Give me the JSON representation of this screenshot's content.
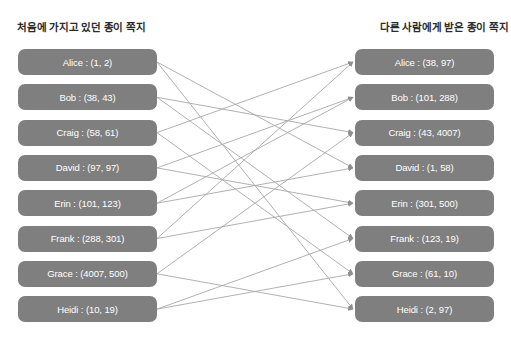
{
  "headers": {
    "left": "처음에 가지고 있던 종이 쪽지",
    "right": "다른 사람에게 받은 종이 쪽지"
  },
  "colors": {
    "node_fill": "#7f7f7f",
    "node_text": "#ffffff",
    "edge": "#a8a8a8",
    "title_text": "#2b2b2b",
    "background": "#ffffff"
  },
  "left_nodes": [
    {
      "name": "Alice",
      "value": "(1, 2)",
      "label": "Alice : (1, 2)"
    },
    {
      "name": "Bob",
      "value": "(38, 43)",
      "label": "Bob : (38, 43)"
    },
    {
      "name": "Craig",
      "value": "(58, 61)",
      "label": "Craig : (58, 61)"
    },
    {
      "name": "David",
      "value": "(97, 97)",
      "label": "David : (97, 97)"
    },
    {
      "name": "Erin",
      "value": "(101, 123)",
      "label": "Erin : (101, 123)"
    },
    {
      "name": "Frank",
      "value": "(288, 301)",
      "label": "Frank : (288, 301)"
    },
    {
      "name": "Grace",
      "value": "(4007, 500)",
      "label": "Grace : (4007, 500)"
    },
    {
      "name": "Heidi",
      "value": "(10, 19)",
      "label": "Heidi : (10, 19)"
    }
  ],
  "right_nodes": [
    {
      "name": "Alice",
      "value": "(38, 97)",
      "label": "Alice : (38, 97)"
    },
    {
      "name": "Bob",
      "value": "(101, 288)",
      "label": "Bob : (101, 288)"
    },
    {
      "name": "Craig",
      "value": "(43, 4007)",
      "label": "Craig : (43, 4007)"
    },
    {
      "name": "David",
      "value": "(1, 58)",
      "label": "David : (1, 58)"
    },
    {
      "name": "Erin",
      "value": "(301, 500)",
      "label": "Erin : (301, 500)"
    },
    {
      "name": "Frank",
      "value": "(123, 19)",
      "label": "Frank : (123, 19)"
    },
    {
      "name": "Grace",
      "value": "(61, 10)",
      "label": "Grace : (61, 10)"
    },
    {
      "name": "Heidi",
      "value": "(2, 97)",
      "label": "Heidi : (2, 97)"
    }
  ],
  "edges": [
    {
      "from": 0,
      "to": 3
    },
    {
      "from": 0,
      "to": 7
    },
    {
      "from": 1,
      "to": 2
    },
    {
      "from": 1,
      "to": 5
    },
    {
      "from": 2,
      "to": 0
    },
    {
      "from": 2,
      "to": 6
    },
    {
      "from": 3,
      "to": 1
    },
    {
      "from": 3,
      "to": 4
    },
    {
      "from": 4,
      "to": 1
    },
    {
      "from": 4,
      "to": 3
    },
    {
      "from": 5,
      "to": 0
    },
    {
      "from": 5,
      "to": 4
    },
    {
      "from": 6,
      "to": 2
    },
    {
      "from": 6,
      "to": 7
    },
    {
      "from": 7,
      "to": 5
    },
    {
      "from": 7,
      "to": 6
    }
  ],
  "geometry": {
    "node_rows_y": [
      49,
      90,
      131,
      171,
      212,
      252,
      293,
      312
    ],
    "left_x": 18,
    "right_x": 355,
    "node_width": 139,
    "node_height": 26
  }
}
